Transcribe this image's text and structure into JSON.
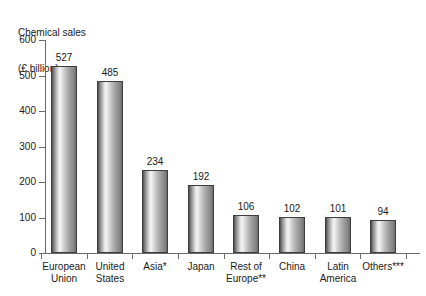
{
  "chart_data": {
    "type": "bar",
    "title": "Chemical sales (€ billion)",
    "title_lines": [
      "Chemical sales",
      "(€ billion)"
    ],
    "xlabel": "",
    "ylabel": "",
    "ylim": [
      0,
      600
    ],
    "yticks": [
      0,
      100,
      200,
      300,
      400,
      500,
      600
    ],
    "ytick_labels": [
      "0",
      "100",
      "200",
      "300",
      "400",
      "500",
      "600"
    ],
    "grid": false,
    "legend": false,
    "categories": [
      "European Union",
      "United States",
      "Asia*",
      "Japan",
      "Rest of Europe**",
      "China",
      "Latin America",
      "Others***"
    ],
    "category_lines": [
      [
        "European",
        "Union"
      ],
      [
        "United",
        "States"
      ],
      [
        "Asia*",
        ""
      ],
      [
        "Japan",
        ""
      ],
      [
        "Rest of",
        "Europe**"
      ],
      [
        "China",
        ""
      ],
      [
        "Latin",
        "America"
      ],
      [
        "Others***",
        ""
      ]
    ],
    "values": [
      527,
      485,
      234,
      192,
      106,
      102,
      101,
      94
    ],
    "value_labels": [
      "527",
      "485",
      "234",
      "192",
      "106",
      "102",
      "101",
      "94"
    ],
    "colors": {
      "bar_light": "#f4f4f4",
      "bar_mid": "#b4b4b4",
      "bar_dark": "#4f4f4f",
      "bar_outline": "#3d3d3d",
      "axis": "#6b6b6b",
      "text": "#1a1a1a",
      "background": "#ffffff"
    }
  }
}
